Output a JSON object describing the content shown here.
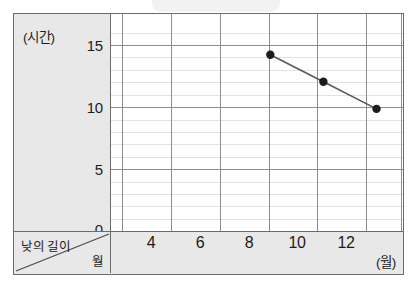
{
  "chart_data": {
    "type": "line",
    "title": "",
    "xlabel": "(월)",
    "ylabel": "(시간)",
    "row_header": "낮의 길이",
    "col_header": "월",
    "x": [
      8,
      10,
      12
    ],
    "values": [
      13,
      11,
      9
    ],
    "series": [
      {
        "name": "낮의 길이",
        "x": [
          8,
          10,
          12
        ],
        "values": [
          13,
          11,
          9
        ]
      }
    ],
    "xlim": [
      2,
      13
    ],
    "ylim": [
      0,
      16
    ],
    "x_tick_labels": [
      "4",
      "6",
      "8",
      "10",
      "12"
    ],
    "x_tick_values": [
      4,
      6,
      8,
      10,
      12
    ],
    "y_tick_labels": [
      "0",
      "5",
      "10",
      "15"
    ],
    "y_tick_values": [
      0,
      5,
      10,
      15
    ],
    "y_minor_step": 1,
    "grid": true,
    "legend": false,
    "marker": "filled-circle",
    "line_color": "#5a5a5a",
    "marker_color": "#1c1c1c",
    "grid_major_color": "#8d8d8d",
    "grid_minor_color": "#e2e2e2",
    "panel_bg": "#e8e8e8",
    "plot_bg": "#ffffff",
    "frame_color": "#6b6b6b"
  }
}
